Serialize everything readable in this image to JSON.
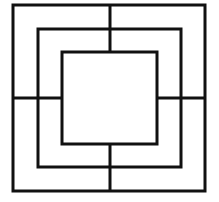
{
  "diagram": {
    "type": "nine-mens-morris-board",
    "colors": {
      "background": "#ffffff",
      "stroke": "#111111"
    },
    "stroke_width": 3,
    "squares": [
      {
        "name": "outer",
        "x": 13,
        "y": 5,
        "w": 192,
        "h": 186
      },
      {
        "name": "middle",
        "x": 38,
        "y": 29,
        "w": 143,
        "h": 138
      },
      {
        "name": "inner",
        "x": 62,
        "y": 52,
        "w": 95,
        "h": 92
      }
    ],
    "connectors": [
      {
        "name": "top",
        "x1": 110,
        "y1": 5,
        "x2": 110,
        "y2": 52
      },
      {
        "name": "bottom",
        "x1": 110,
        "y1": 144,
        "x2": 110,
        "y2": 191
      },
      {
        "name": "left",
        "x1": 13,
        "y1": 98,
        "x2": 62,
        "y2": 98
      },
      {
        "name": "right",
        "x1": 157,
        "y1": 98,
        "x2": 205,
        "y2": 98
      }
    ]
  }
}
